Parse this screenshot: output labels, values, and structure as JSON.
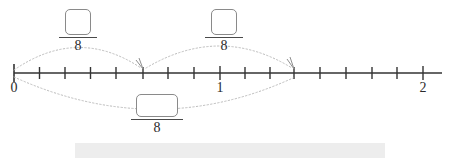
{
  "figure": {
    "type": "number-line-fraction-diagram",
    "line": {
      "start_label": "0",
      "mid_label": "1",
      "end_label": "2",
      "tick_count": 17,
      "subdivisions_per_unit": 8
    },
    "labels": [
      {
        "name": "tick-label-0",
        "text": "0",
        "value": 0,
        "x": 14
      },
      {
        "name": "tick-label-1",
        "text": "1",
        "value": 1,
        "x": 220
      },
      {
        "name": "tick-label-2",
        "text": "2",
        "value": 2,
        "x": 423
      }
    ],
    "fractions": [
      {
        "id": "fraction-a",
        "name": "fraction-first-jump",
        "numerator": "",
        "numerator_placeholder": "",
        "denominator": "8",
        "represents": "5/8"
      },
      {
        "id": "fraction-b",
        "name": "fraction-second-jump",
        "numerator": "",
        "numerator_placeholder": "",
        "denominator": "8",
        "represents": "6/8"
      },
      {
        "id": "fraction-c",
        "name": "fraction-total-jump",
        "numerator": "",
        "numerator_placeholder": "",
        "denominator": "8",
        "represents": "11/8"
      }
    ],
    "arcs": [
      {
        "name": "arc-first-jump",
        "from_value": 0,
        "to_value": 0.625,
        "direction": "above",
        "style": "dotted",
        "arrowhead": true
      },
      {
        "name": "arc-second-jump",
        "from_value": 0.625,
        "to_value": 1.375,
        "direction": "above",
        "style": "dotted",
        "arrowhead": true
      },
      {
        "name": "arc-total-jump",
        "from_value": 0,
        "to_value": 1.375,
        "direction": "below",
        "style": "dotted",
        "arrowhead": false
      }
    ],
    "colors": {
      "line": "#333333",
      "arc": "#b9b9b9",
      "box_border": "#8a8a8a",
      "text": "#2b2b2b",
      "strip": "#ededed",
      "background": "#ffffff"
    }
  }
}
